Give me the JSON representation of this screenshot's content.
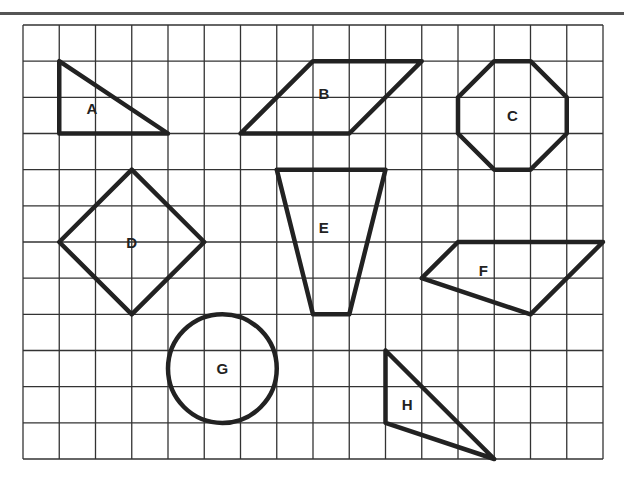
{
  "grid": {
    "columns": 16,
    "rows": 12,
    "line_color": "#333333",
    "shape_color": "#222222"
  },
  "shapes": [
    {
      "label": "A",
      "type": "triangle",
      "points": [
        [
          1,
          1
        ],
        [
          1,
          3
        ],
        [
          4,
          3
        ]
      ],
      "label_pos": [
        1.9,
        2.3
      ]
    },
    {
      "label": "B",
      "type": "parallelogram",
      "points": [
        [
          6,
          3
        ],
        [
          8,
          1
        ],
        [
          11,
          1
        ],
        [
          9,
          3
        ]
      ],
      "label_pos": [
        8.3,
        1.9
      ]
    },
    {
      "label": "C",
      "type": "octagon",
      "points": [
        [
          12,
          2
        ],
        [
          13,
          1
        ],
        [
          14,
          1
        ],
        [
          15,
          2
        ],
        [
          15,
          3
        ],
        [
          14,
          4
        ],
        [
          13,
          4
        ],
        [
          12,
          3
        ]
      ],
      "label_pos": [
        13.5,
        2.5
      ]
    },
    {
      "label": "D",
      "type": "square",
      "points": [
        [
          3,
          4
        ],
        [
          5,
          6
        ],
        [
          3,
          8
        ],
        [
          1,
          6
        ]
      ],
      "label_pos": [
        3,
        6
      ]
    },
    {
      "label": "E",
      "type": "trapezoid",
      "points": [
        [
          7,
          4
        ],
        [
          10,
          4
        ],
        [
          9,
          8
        ],
        [
          8,
          8
        ]
      ],
      "label_pos": [
        8.3,
        5.6
      ]
    },
    {
      "label": "F",
      "type": "quadrilateral",
      "points": [
        [
          11,
          7
        ],
        [
          12,
          6
        ],
        [
          16,
          6
        ],
        [
          14,
          8
        ]
      ],
      "label_pos": [
        12.7,
        6.8
      ]
    },
    {
      "label": "G",
      "type": "circle",
      "center": [
        5.5,
        9.5
      ],
      "radius": 1.5,
      "label_pos": [
        5.5,
        9.5
      ]
    },
    {
      "label": "H",
      "type": "triangle",
      "points": [
        [
          10,
          9
        ],
        [
          10,
          11
        ],
        [
          13,
          12
        ]
      ],
      "label_pos": [
        10.6,
        10.5
      ]
    }
  ]
}
